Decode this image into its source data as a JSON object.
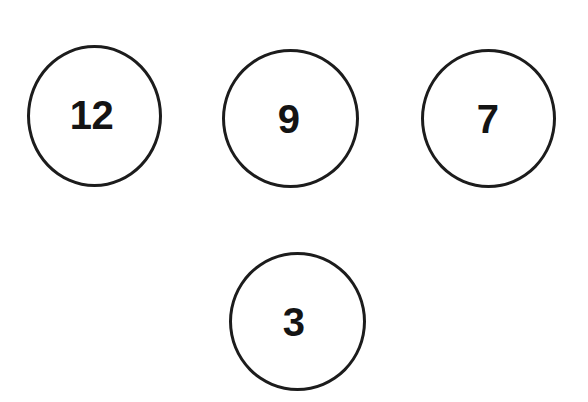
{
  "canvas": {
    "width": 588,
    "height": 402,
    "background_color": "#ffffff"
  },
  "style": {
    "circle_stroke_color": "#1c1c1c",
    "circle_stroke_width": 3,
    "circle_fill": "none",
    "label_color": "#141414",
    "label_weight": "bold"
  },
  "diagram": {
    "type": "number-circles",
    "circle_count": 4,
    "circles": [
      {
        "id": "circle-12",
        "label": "12",
        "value": 12,
        "center_x": 94,
        "center_y": 116,
        "diameter": 138,
        "row": 1,
        "column": 1
      },
      {
        "id": "circle-9",
        "label": "9",
        "value": 9,
        "center_x": 290,
        "center_y": 118,
        "diameter": 138,
        "row": 1,
        "column": 2
      },
      {
        "id": "circle-7",
        "label": "7",
        "value": 7,
        "center_x": 488,
        "center_y": 118,
        "diameter": 137,
        "row": 1,
        "column": 3
      },
      {
        "id": "circle-3",
        "label": "3",
        "value": 3,
        "center_x": 297,
        "center_y": 321,
        "diameter": 138,
        "row": 2,
        "column": 2
      }
    ]
  }
}
